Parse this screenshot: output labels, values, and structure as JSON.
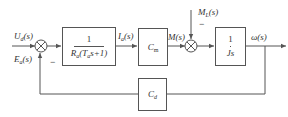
{
  "diagram": {
    "type": "control-system-block-diagram",
    "inputs": {
      "reference": "U_d(s)",
      "reference_main": "U",
      "reference_sub": "d",
      "reference_arg": "(s)",
      "back_emf": "E_a(s)",
      "back_emf_main": "E",
      "back_emf_sub": "a",
      "back_emf_arg": "(s)",
      "load_torque": "M_L(s)",
      "load_torque_main": "M",
      "load_torque_sub": "L",
      "load_torque_arg": "(s)"
    },
    "signals": {
      "current_main": "I",
      "current_sub": "a",
      "current_arg": "(s)",
      "torque": "M(s)",
      "output": "ω(s)"
    },
    "blocks": {
      "armature": {
        "numerator": "1",
        "denominator_R": "R",
        "denominator_R_sub": "a",
        "denominator_open": "(T",
        "denominator_T_sub": "a",
        "denominator_close": "s+1)"
      },
      "torque_constant": {
        "main": "C",
        "sub": "m"
      },
      "inertia": {
        "numerator": "1",
        "denominator": "Js"
      },
      "feedback": {
        "main": "C",
        "sub": "d"
      }
    },
    "signs": {
      "junction1_feedback": "−",
      "junction2_load": "−"
    },
    "colors": {
      "line": "#555555",
      "text": "#333333",
      "background": "#ffffff"
    }
  }
}
